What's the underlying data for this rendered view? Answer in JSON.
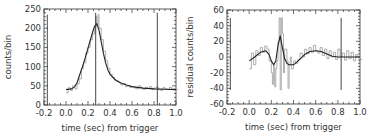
{
  "chart_data": [
    {
      "type": "line",
      "panel": "left",
      "title": "",
      "xlabel": "time (sec) from trigger",
      "ylabel": "counts/bin",
      "xlim": [
        -0.2,
        1.0
      ],
      "ylim": [
        0,
        250
      ],
      "xticks": [
        "-0.2",
        "0.0",
        "0.2",
        "0.4",
        "0.6",
        "0.8",
        "1.0"
      ],
      "yticks": [
        "0",
        "50",
        "100",
        "150",
        "200",
        "250"
      ],
      "grid": false,
      "legend": null,
      "vertical_lines": [
        {
          "x": -0.17,
          "y_from": 0,
          "y_to": 235
        },
        {
          "x": 0.27,
          "y_from": 0,
          "y_to": 240
        },
        {
          "x": 0.83,
          "y_from": 0,
          "y_to": 240
        }
      ],
      "series": [
        {
          "name": "data (histogram)",
          "color": "#999999",
          "x": [
            0.0,
            0.02,
            0.04,
            0.06,
            0.08,
            0.1,
            0.12,
            0.14,
            0.16,
            0.18,
            0.2,
            0.22,
            0.24,
            0.26,
            0.27,
            0.28,
            0.29,
            0.3,
            0.32,
            0.34,
            0.36,
            0.38,
            0.4,
            0.42,
            0.44,
            0.46,
            0.48,
            0.5,
            0.52,
            0.54,
            0.56,
            0.58,
            0.6,
            0.62,
            0.64,
            0.66,
            0.68,
            0.7,
            0.72,
            0.74,
            0.76,
            0.78,
            0.8,
            0.82,
            0.84,
            0.86,
            0.88,
            0.9,
            0.92,
            0.94,
            0.96,
            0.98,
            1.0
          ],
          "y": [
            32,
            45,
            38,
            50,
            42,
            55,
            68,
            95,
            110,
            135,
            150,
            170,
            185,
            198,
            230,
            205,
            235,
            200,
            170,
            140,
            115,
            95,
            80,
            72,
            65,
            62,
            58,
            52,
            56,
            48,
            50,
            46,
            48,
            44,
            42,
            50,
            45,
            40,
            46,
            43,
            48,
            40,
            44,
            47,
            40,
            38,
            45,
            42,
            40,
            46,
            41,
            43,
            40
          ]
        },
        {
          "name": "model fit",
          "color": "#222222",
          "x": [
            0.0,
            0.05,
            0.08,
            0.1,
            0.12,
            0.15,
            0.18,
            0.2,
            0.22,
            0.24,
            0.26,
            0.28,
            0.3,
            0.32,
            0.34,
            0.36,
            0.38,
            0.4,
            0.45,
            0.5,
            0.55,
            0.6,
            0.7,
            0.8,
            0.9,
            1.0
          ],
          "y": [
            40,
            42,
            48,
            58,
            75,
            100,
            128,
            148,
            168,
            188,
            205,
            212,
            195,
            165,
            135,
            110,
            92,
            80,
            65,
            57,
            52,
            48,
            44,
            42,
            41,
            40
          ]
        }
      ]
    },
    {
      "type": "line",
      "panel": "right",
      "title": "",
      "xlabel": "time (sec) from trigger",
      "ylabel": "residual counts/bin",
      "xlim": [
        -0.2,
        1.0
      ],
      "ylim": [
        -60,
        60
      ],
      "xticks": [
        "-0.2",
        "0.0",
        "0.2",
        "0.4",
        "0.6",
        "0.8",
        "1.0"
      ],
      "yticks": [
        "-60",
        "-40",
        "-20",
        "0",
        "20",
        "40",
        "60"
      ],
      "grid": false,
      "legend": null,
      "vertical_lines": [
        {
          "x": -0.17,
          "y_from": -42,
          "y_to": 50
        },
        {
          "x": 0.83,
          "y_from": -42,
          "y_to": 50
        }
      ],
      "series": [
        {
          "name": "residuals (histogram)",
          "color": "#999999",
          "x": [
            0.0,
            0.02,
            0.04,
            0.06,
            0.08,
            0.1,
            0.12,
            0.14,
            0.16,
            0.18,
            0.2,
            0.21,
            0.22,
            0.23,
            0.24,
            0.25,
            0.26,
            0.27,
            0.28,
            0.29,
            0.3,
            0.31,
            0.32,
            0.34,
            0.35,
            0.36,
            0.37,
            0.38,
            0.4,
            0.42,
            0.44,
            0.46,
            0.48,
            0.5,
            0.52,
            0.54,
            0.56,
            0.58,
            0.6,
            0.62,
            0.64,
            0.66,
            0.68,
            0.7,
            0.72,
            0.74,
            0.76,
            0.78,
            0.8,
            0.82,
            0.84,
            0.86,
            0.88,
            0.9,
            0.92,
            0.94,
            0.96,
            0.98,
            1.0
          ],
          "y": [
            -15,
            5,
            -10,
            8,
            2,
            12,
            6,
            14,
            10,
            -5,
            -20,
            -35,
            -10,
            -38,
            -15,
            -5,
            20,
            50,
            -42,
            50,
            30,
            -20,
            10,
            -5,
            -40,
            -10,
            0,
            -15,
            -5,
            -8,
            -3,
            5,
            0,
            10,
            4,
            12,
            6,
            15,
            8,
            5,
            12,
            2,
            10,
            -2,
            8,
            0,
            6,
            -3,
            10,
            0,
            5,
            -4,
            8,
            -2,
            6,
            -5,
            3,
            0,
            -3
          ]
        },
        {
          "name": "smooth fit",
          "color": "#222222",
          "x": [
            0.0,
            0.05,
            0.1,
            0.15,
            0.18,
            0.2,
            0.22,
            0.24,
            0.26,
            0.28,
            0.3,
            0.32,
            0.34,
            0.36,
            0.4,
            0.45,
            0.5,
            0.55,
            0.6,
            0.65,
            0.7,
            0.75,
            0.8,
            0.85,
            0.9,
            0.95,
            1.0
          ],
          "y": [
            -5,
            0,
            6,
            8,
            3,
            -5,
            -10,
            -5,
            15,
            27,
            12,
            -2,
            -8,
            -10,
            -10,
            -4,
            3,
            7,
            8,
            7,
            4,
            1,
            0,
            0,
            0,
            0,
            0
          ]
        }
      ]
    }
  ]
}
